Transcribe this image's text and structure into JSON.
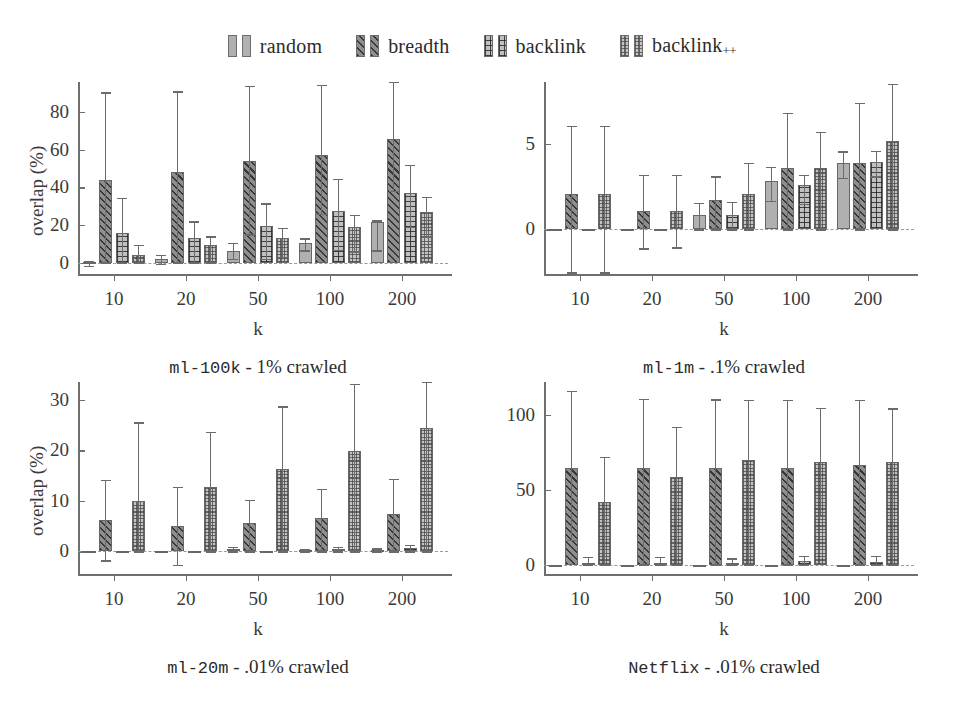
{
  "legend": {
    "entries": [
      {
        "label": "random",
        "key": "random",
        "pattern": "p-plain"
      },
      {
        "label": "breadth",
        "key": "breadth",
        "pattern": "p-diag"
      },
      {
        "label": "backlink",
        "key": "backlink",
        "pattern": "p-grid"
      },
      {
        "label": "backlink",
        "key": "backlinkpp",
        "pattern": "p-dot",
        "sub": "++"
      }
    ]
  },
  "chart_data": [
    {
      "id": "ml100k",
      "type": "bar",
      "title": "ml-100k - 1% crawled",
      "title_mono": "ml-100k",
      "title_rest": " - 1% crawled",
      "xlabel": "k",
      "ylabel": "overlap (%)",
      "categories": [
        "10",
        "20",
        "50",
        "100",
        "200"
      ],
      "yticks": [
        0,
        20,
        40,
        60,
        80
      ],
      "ylim": [
        -6,
        96
      ],
      "grid": false,
      "legend_position": "figure-top",
      "series": [
        {
          "name": "random",
          "values": [
            0.3,
            1.8,
            6.0,
            10.5,
            21.5
          ],
          "err_low": [
            -1.5,
            -0.5,
            2.0,
            6.5,
            6.5
          ],
          "err_high": [
            0.8,
            4.0,
            10.5,
            13.0,
            22.5
          ]
        },
        {
          "name": "breadth",
          "values": [
            44.0,
            48.0,
            54.0,
            57.0,
            65.5
          ],
          "err_low": [
            0.0,
            0.0,
            15.0,
            26.0,
            38.0
          ],
          "err_high": [
            90.5,
            91.0,
            94.0,
            94.5,
            96.0
          ]
        },
        {
          "name": "backlink",
          "values": [
            16.0,
            13.0,
            19.5,
            27.5,
            37.0
          ],
          "err_low": [
            0.0,
            0.0,
            2.0,
            7.0,
            19.0
          ],
          "err_high": [
            34.5,
            22.0,
            31.5,
            44.5,
            52.0
          ]
        },
        {
          "name": "backlinkpp",
          "values": [
            4.0,
            9.5,
            13.0,
            19.0,
            27.0
          ],
          "err_low": [
            0.0,
            0.0,
            3.0,
            6.0,
            14.0
          ],
          "err_high": [
            9.5,
            14.0,
            18.5,
            25.5,
            35.0
          ]
        }
      ]
    },
    {
      "id": "ml1m",
      "type": "bar",
      "title": "ml-1m - .1% crawled",
      "title_mono": "ml-1m",
      "title_rest": " - .1% crawled",
      "xlabel": "k",
      "ylabel": "",
      "categories": [
        "10",
        "20",
        "50",
        "100",
        "200"
      ],
      "yticks": [
        0,
        5
      ],
      "ylim": [
        -2.6,
        8.6
      ],
      "grid": false,
      "legend_position": "figure-top",
      "series": [
        {
          "name": "random",
          "values": [
            0.0,
            0.0,
            0.85,
            2.85,
            3.9
          ],
          "err_low": [
            0.0,
            0.0,
            0.0,
            1.65,
            3.0
          ],
          "err_high": [
            0.0,
            0.0,
            1.55,
            3.65,
            4.55
          ]
        },
        {
          "name": "breadth",
          "values": [
            2.05,
            1.1,
            1.7,
            3.6,
            3.85
          ],
          "err_low": [
            -2.5,
            -1.1,
            0.0,
            0.0,
            0.0
          ],
          "err_high": [
            6.05,
            3.2,
            3.1,
            6.8,
            7.4
          ]
        },
        {
          "name": "backlink",
          "values": [
            0.0,
            0.0,
            0.85,
            2.6,
            3.95
          ],
          "err_low": [
            0.0,
            0.0,
            0.0,
            1.5,
            3.1
          ],
          "err_high": [
            0.0,
            0.0,
            1.6,
            3.2,
            4.6
          ]
        },
        {
          "name": "backlinkpp",
          "values": [
            2.05,
            1.05,
            2.05,
            3.6,
            5.15
          ],
          "err_low": [
            -2.5,
            -1.05,
            0.0,
            0.0,
            0.0
          ],
          "err_high": [
            6.05,
            3.2,
            3.9,
            5.7,
            8.5
          ]
        }
      ]
    },
    {
      "id": "ml20m",
      "type": "bar",
      "title": "ml-20m - .01% crawled",
      "title_mono": "ml-20m",
      "title_rest": " - .01% crawled",
      "xlabel": "k",
      "ylabel": "overlap (%)",
      "categories": [
        "10",
        "20",
        "50",
        "100",
        "200"
      ],
      "yticks": [
        0,
        10,
        20,
        30
      ],
      "ylim": [
        -4.5,
        33.5
      ],
      "grid": false,
      "legend_position": "figure-top",
      "series": [
        {
          "name": "random",
          "values": [
            0.0,
            0.0,
            0.35,
            0.2,
            0.3
          ],
          "err_low": [
            0.0,
            0.0,
            0.0,
            0.0,
            0.0
          ],
          "err_high": [
            0.0,
            0.0,
            0.9,
            0.4,
            0.6
          ]
        },
        {
          "name": "breadth",
          "values": [
            6.1,
            5.0,
            5.6,
            6.6,
            7.4
          ],
          "err_low": [
            -1.8,
            -2.7,
            0.0,
            0.0,
            0.0
          ],
          "err_high": [
            14.1,
            12.7,
            10.2,
            12.3,
            14.4
          ]
        },
        {
          "name": "backlink",
          "values": [
            0.0,
            0.0,
            0.0,
            0.5,
            0.6
          ],
          "err_low": [
            0.0,
            0.0,
            0.0,
            0.0,
            0.0
          ],
          "err_high": [
            0.0,
            0.0,
            0.0,
            0.9,
            1.2
          ]
        },
        {
          "name": "backlinkpp",
          "values": [
            9.9,
            12.8,
            16.2,
            19.8,
            24.3
          ],
          "err_low": [
            0.0,
            0.0,
            0.0,
            0.0,
            0.0
          ],
          "err_high": [
            25.5,
            23.6,
            28.7,
            33.2,
            33.5
          ]
        }
      ]
    },
    {
      "id": "netflix",
      "type": "bar",
      "title": "Netflix - .01% crawled",
      "title_mono": "Netflix",
      "title_rest": " - .01% crawled",
      "xlabel": "k",
      "ylabel": "",
      "categories": [
        "10",
        "20",
        "50",
        "100",
        "200"
      ],
      "yticks": [
        0,
        50,
        100
      ],
      "ylim": [
        -6,
        122
      ],
      "grid": false,
      "legend_position": "figure-top",
      "series": [
        {
          "name": "random",
          "values": [
            0.0,
            0.0,
            0.0,
            0.0,
            0.0
          ],
          "err_low": [
            0.0,
            0.0,
            0.0,
            0.0,
            0.0
          ],
          "err_high": [
            0.0,
            0.0,
            0.0,
            0.0,
            0.0
          ]
        },
        {
          "name": "breadth",
          "values": [
            65.0,
            65.0,
            65.0,
            64.5,
            66.5
          ],
          "err_low": [
            17.0,
            0.0,
            0.0,
            0.0,
            0.0
          ],
          "err_high": [
            116.0,
            111.0,
            110.5,
            110.0,
            110.0
          ]
        },
        {
          "name": "backlink",
          "values": [
            1.5,
            1.5,
            1.5,
            2.5,
            2.0
          ],
          "err_low": [
            0.0,
            0.0,
            0.0,
            0.0,
            0.0
          ],
          "err_high": [
            5.5,
            5.5,
            4.5,
            6.0,
            6.0
          ]
        },
        {
          "name": "backlinkpp",
          "values": [
            42.0,
            58.5,
            70.0,
            68.5,
            68.5
          ],
          "err_low": [
            0.0,
            0.0,
            0.0,
            33.0,
            0.0
          ],
          "err_high": [
            72.0,
            92.0,
            110.0,
            105.0,
            104.5
          ]
        }
      ]
    }
  ]
}
